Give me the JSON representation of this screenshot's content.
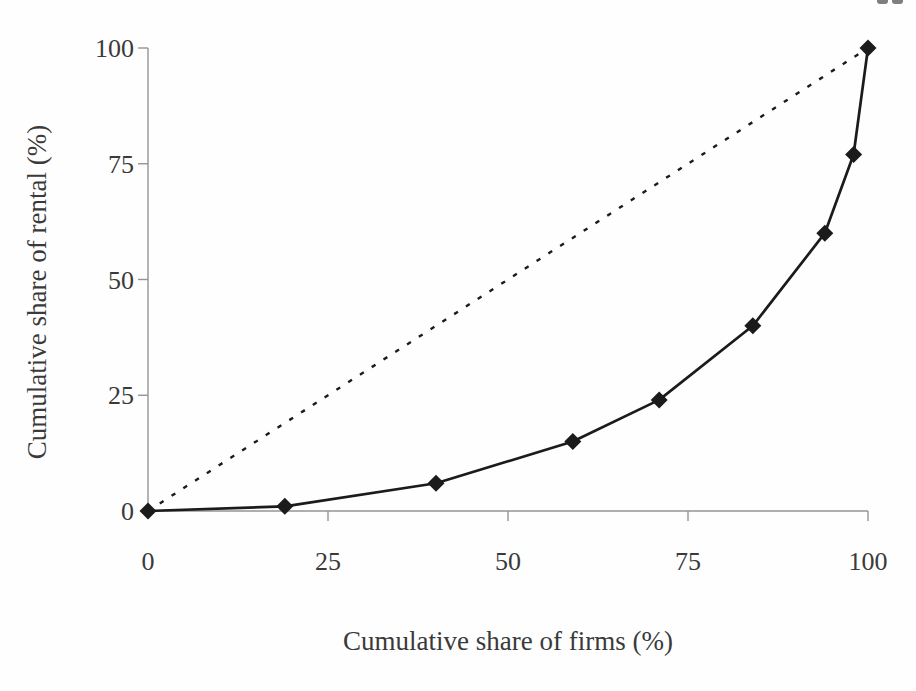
{
  "page": {
    "cropped_page_number_fragment_visible": true
  },
  "chart_data": {
    "type": "line",
    "title": "",
    "xlabel": "Cumulative share of firms (%)",
    "ylabel": "Cumulative share of rental (%)",
    "xlim": [
      0,
      100
    ],
    "ylim": [
      0,
      100
    ],
    "x_ticks": [
      "0",
      "25",
      "50",
      "75",
      "100"
    ],
    "x_tick_values": [
      0,
      25,
      50,
      75,
      100
    ],
    "y_ticks": [
      "0",
      "25",
      "50",
      "75",
      "100"
    ],
    "y_tick_values": [
      0,
      25,
      50,
      75,
      100
    ],
    "grid": false,
    "legend": false,
    "axis_color": "#949494",
    "text_color": "#3a3a3a",
    "series": [
      {
        "name": "cumulative-rental-share-curve",
        "style": "solid",
        "marker": "diamond",
        "color": "#1b1b1b",
        "x": [
          0,
          19,
          40,
          59,
          71,
          84,
          94,
          98,
          100
        ],
        "y": [
          0,
          1,
          6,
          15,
          24,
          40,
          60,
          77,
          100
        ]
      },
      {
        "name": "line-of-equality",
        "style": "dashed",
        "marker": "none",
        "color": "#1b1b1b",
        "x": [
          0,
          100
        ],
        "y": [
          0,
          100
        ]
      }
    ]
  }
}
